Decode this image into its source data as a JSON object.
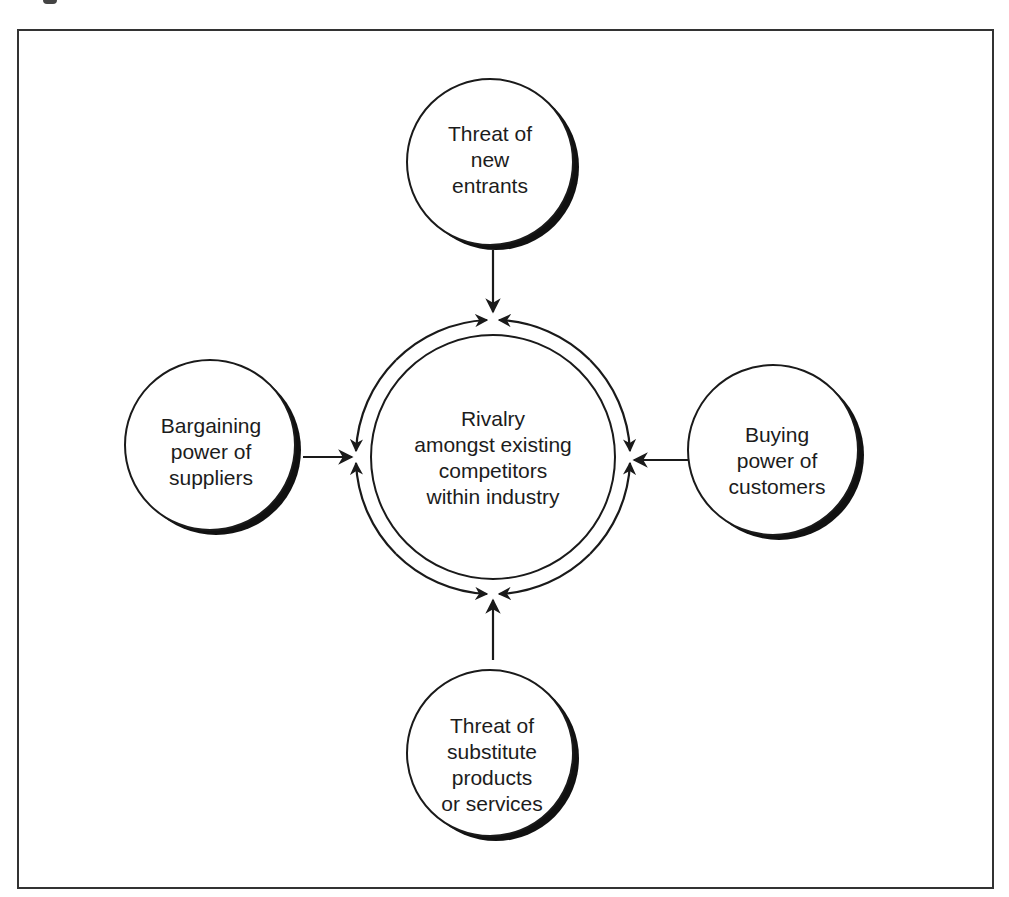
{
  "diagram": {
    "type": "porter-five-forces",
    "center": {
      "label_lines": [
        "Rivalry",
        "amongst existing",
        "competitors",
        "within industry"
      ]
    },
    "forces": [
      {
        "id": "top",
        "position": "top",
        "label_lines": [
          "Threat of",
          "new",
          "entrants"
        ],
        "arrow_direction": "down-to-center"
      },
      {
        "id": "left",
        "position": "left",
        "label_lines": [
          "Bargaining",
          "power of",
          "suppliers"
        ],
        "arrow_direction": "right-to-center"
      },
      {
        "id": "right",
        "position": "right",
        "label_lines": [
          "Buying",
          "power of",
          "customers"
        ],
        "arrow_direction": "left-to-center"
      },
      {
        "id": "bottom",
        "position": "bottom",
        "label_lines": [
          "Threat of",
          "substitute",
          "products",
          "or services"
        ],
        "arrow_direction": "up-to-center"
      }
    ],
    "colors": {
      "stroke": "#1a1a1a",
      "shadow": "#111111",
      "background": "#ffffff",
      "frame": "#333333"
    }
  }
}
